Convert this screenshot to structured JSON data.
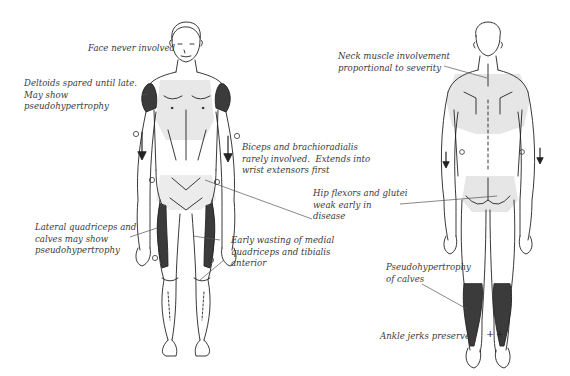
{
  "figure": {
    "views": [
      "anterior",
      "posterior"
    ],
    "colors": {
      "outline": "#222222",
      "hypertrophy_shade": "#3b3b3b",
      "weakness_shade": "#e6e6e6",
      "label_text": "#3a3a3a",
      "leader_line": "#555555"
    },
    "symbols": {
      "reflex_absent": "o",
      "reflex_present": "++",
      "progression_arrow": "down-arrow"
    }
  },
  "labels": {
    "face": "Face never involved",
    "deltoids": "Deltoids spared until late.\nMay show\npseudohypertrophy",
    "biceps": "Biceps and brachioradialis\nrarely involved.  Extends into\nwrist extensors first",
    "hip": "Hip flexors and glutei\nweak early in\ndisease",
    "lateral_quads": "Lateral quadriceps and\ncalves may show\npseudohypertrophy",
    "medial_quads": "Early wasting of medial\nquadriceps and tibialis\nanterior",
    "neck": "Neck muscle involvement\nproportional to severity",
    "calves": "Pseudohypertrophy\nof calves",
    "ankle": "Ankle jerks preserved"
  },
  "marks": {
    "reflex_circle": "o",
    "ankle_plus": "++"
  }
}
